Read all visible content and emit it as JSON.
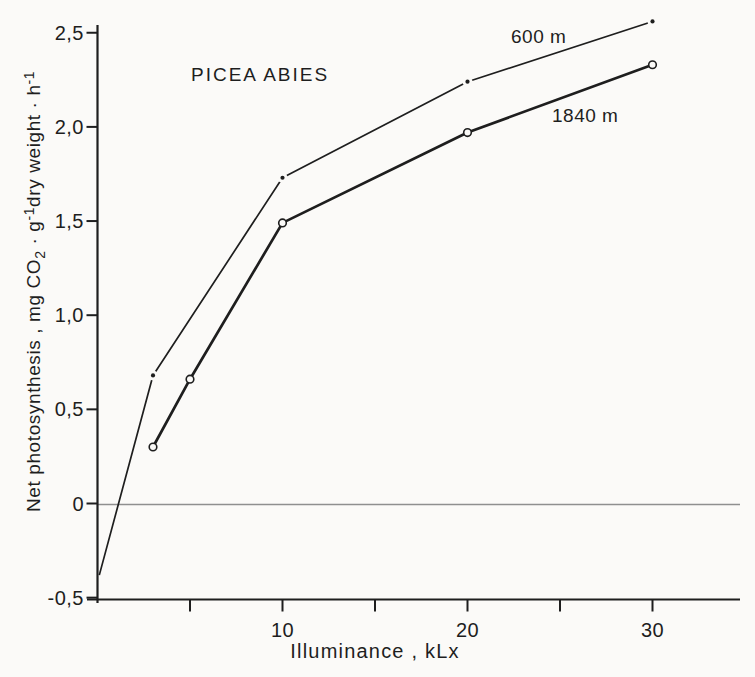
{
  "colors": {
    "background": "#fbfaf8",
    "ink": "#1e1e1e",
    "zero_line": "#8f8f8f"
  },
  "chart_data": {
    "type": "line",
    "title": "PICEA ABIES",
    "xlabel": "Illuminance , kLx",
    "ylabel": "Net photosynthesis , mg CO₂·g⁻¹dry weight·h⁻¹",
    "ylabel_parts": [
      {
        "text": "Net photosynthesis ,  mg CO",
        "script": "normal"
      },
      {
        "text": "2",
        "script": "sub"
      },
      {
        "text": " · g",
        "script": "normal"
      },
      {
        "text": "-1",
        "script": "sup"
      },
      {
        "text": "dry weight · h",
        "script": "normal"
      },
      {
        "text": "-1",
        "script": "sup"
      }
    ],
    "xlim": [
      0,
      34.7
    ],
    "ylim": [
      -0.5,
      2.55
    ],
    "grid": false,
    "zero_line": true,
    "legend_position": "inline-curve-labels",
    "x_ticks": [
      {
        "value": 5,
        "label": ""
      },
      {
        "value": 10,
        "label": "10"
      },
      {
        "value": 15,
        "label": ""
      },
      {
        "value": 20,
        "label": "20"
      },
      {
        "value": 25,
        "label": ""
      },
      {
        "value": 30,
        "label": "30"
      }
    ],
    "y_ticks": [
      {
        "value": 2.5,
        "label": "2,5"
      },
      {
        "value": 2.0,
        "label": "2,0"
      },
      {
        "value": 1.5,
        "label": "1,5"
      },
      {
        "value": 1.0,
        "label": "1,0"
      },
      {
        "value": 0.5,
        "label": "0,5"
      },
      {
        "value": 0,
        "label": "0"
      },
      {
        "value": -0.5,
        "label": "-0,5"
      }
    ],
    "series": [
      {
        "name": "600 m",
        "marker": "dot",
        "line_width": 1.7,
        "points": [
          [
            0.1,
            -0.38
          ],
          [
            3,
            0.68
          ],
          [
            10,
            1.73
          ],
          [
            20,
            2.24
          ],
          [
            30,
            2.56
          ]
        ],
        "marker_points": [
          [
            3,
            0.68
          ],
          [
            10,
            1.73
          ],
          [
            20,
            2.24
          ],
          [
            30,
            2.56
          ]
        ]
      },
      {
        "name": "1840 m",
        "marker": "open-circle",
        "line_width": 2.7,
        "points": [
          [
            3,
            0.3
          ],
          [
            5,
            0.66
          ],
          [
            10,
            1.49
          ],
          [
            20,
            1.97
          ],
          [
            30,
            2.33
          ]
        ],
        "marker_points": [
          [
            3,
            0.3
          ],
          [
            5,
            0.66
          ],
          [
            10,
            1.49
          ],
          [
            20,
            1.97
          ],
          [
            30,
            2.33
          ]
        ]
      }
    ]
  }
}
